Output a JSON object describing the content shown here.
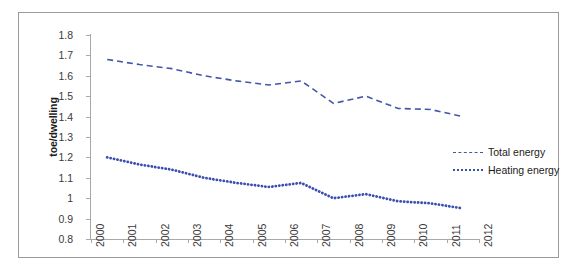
{
  "chart_data": {
    "type": "line",
    "title": "",
    "subtitle": "",
    "xlabel": "",
    "ylabel": "toe/dwelling",
    "xlim": [
      1999.5,
      2012.5
    ],
    "ylim": [
      0.8,
      1.8
    ],
    "ytick_step": 0.1,
    "grid": false,
    "legend_position": "middle-right",
    "x": [
      2000,
      2001,
      2002,
      2003,
      2004,
      2005,
      2006,
      2007,
      2008,
      2009,
      2010,
      2011
    ],
    "xtick_labels": [
      "2000",
      "2001",
      "2002",
      "2003",
      "2004",
      "2005",
      "2006",
      "2007",
      "2008",
      "2009",
      "2010",
      "2011",
      "2012"
    ],
    "ytick_labels": [
      "1.8",
      "1.7",
      "1.6",
      "1.5",
      "1.4",
      "1.3",
      "1.2",
      "1.1",
      "1",
      "0.9",
      "0.8"
    ],
    "ytick_values": [
      1.8,
      1.7,
      1.6,
      1.5,
      1.4,
      1.3,
      1.2,
      1.1,
      1.0,
      0.9,
      0.8
    ],
    "series": [
      {
        "name": "Total energy",
        "color": "#4257a8",
        "style": "dashed",
        "values": [
          1.68,
          1.655,
          1.635,
          1.6,
          1.575,
          1.555,
          1.575,
          1.465,
          1.5,
          1.44,
          1.435,
          1.4
        ]
      },
      {
        "name": "Heating energy",
        "color": "#3b4fb0",
        "style": "dotted",
        "values": [
          1.2,
          1.165,
          1.14,
          1.1,
          1.075,
          1.055,
          1.075,
          1.0,
          1.02,
          0.985,
          0.975,
          0.95
        ]
      }
    ]
  },
  "legend": {
    "items": [
      {
        "label": "Total energy",
        "style": "dashed"
      },
      {
        "label": "Heating energy",
        "style": "dotted"
      }
    ]
  },
  "axis": {
    "y_title": "toe/dwelling"
  }
}
